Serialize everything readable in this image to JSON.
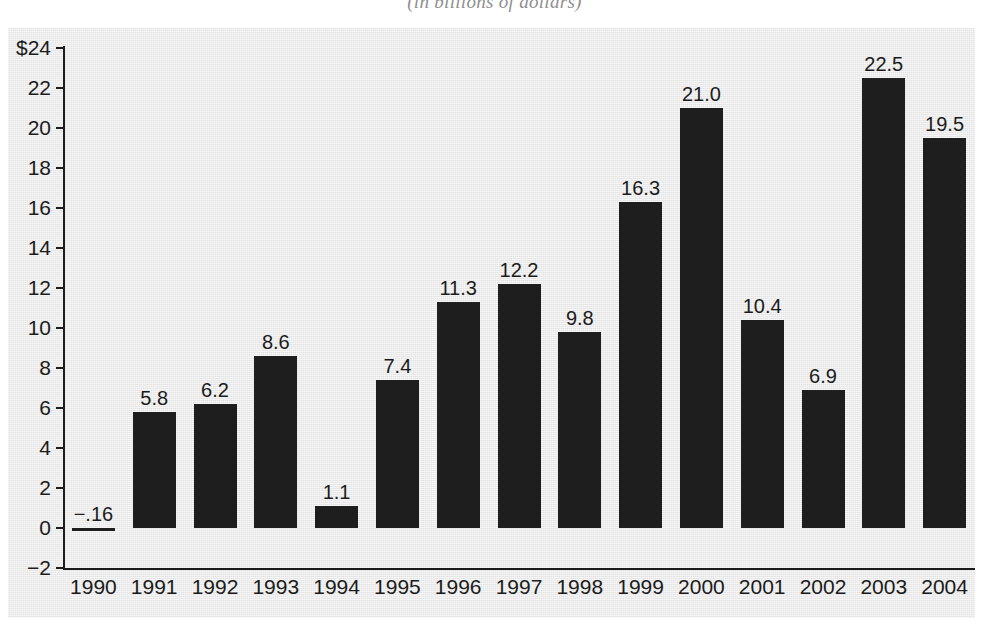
{
  "chart_data": {
    "type": "bar",
    "title": "",
    "subtitle": "(in billions of dollars)",
    "xlabel": "",
    "ylabel": "",
    "categories": [
      "1990",
      "1991",
      "1992",
      "1993",
      "1994",
      "1995",
      "1996",
      "1997",
      "1998",
      "1999",
      "2000",
      "2001",
      "2002",
      "2003",
      "2004"
    ],
    "values": [
      -0.16,
      5.8,
      6.2,
      8.6,
      1.1,
      7.4,
      11.3,
      12.2,
      9.8,
      16.3,
      21.0,
      10.4,
      6.9,
      22.5,
      19.5
    ],
    "value_labels": [
      "−.16",
      "5.8",
      "6.2",
      "8.6",
      "1.1",
      "7.4",
      "11.3",
      "12.2",
      "9.8",
      "16.3",
      "21.0",
      "10.4",
      "6.9",
      "22.5",
      "19.5"
    ],
    "ylim": [
      -2,
      24
    ],
    "ytick_values": [
      24,
      22,
      20,
      18,
      16,
      14,
      12,
      10,
      8,
      6,
      4,
      2,
      0,
      -2
    ],
    "ytick_labels": [
      "$24",
      "22",
      "20",
      "18",
      "16",
      "14",
      "12",
      "10",
      "8",
      "6",
      "4",
      "2",
      "0",
      "−2"
    ],
    "grid": false,
    "legend": null,
    "bar_color": "#1e1e1e",
    "panel_color": "#e3e3e3",
    "axis_color": "#1c1c1c",
    "text_color": "#1b1b1b"
  }
}
